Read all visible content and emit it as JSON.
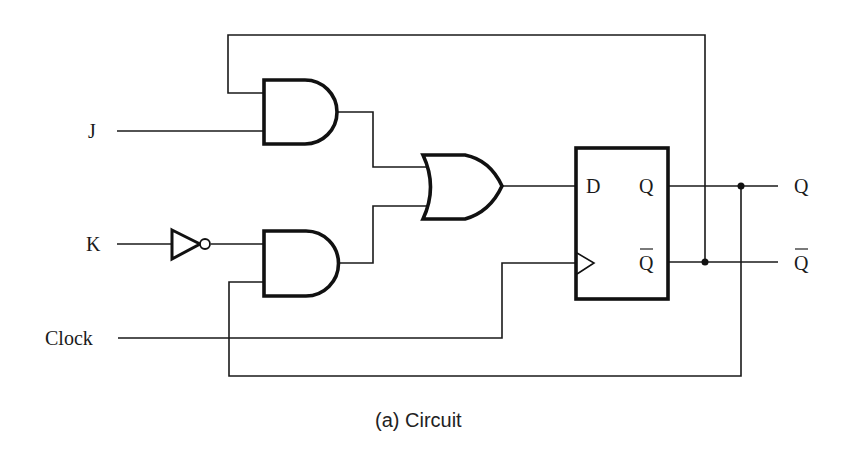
{
  "diagram": {
    "type": "logic-circuit",
    "caption": "(a) Circuit",
    "inputs": {
      "j": "J",
      "k": "K",
      "clock": "Clock"
    },
    "flipflop": {
      "d": "D",
      "q": "Q",
      "qbar": "Q"
    },
    "outputs": {
      "q": "Q",
      "qbar": "Q"
    },
    "components": [
      "AND gate (J)",
      "AND gate (K)",
      "NOT gate",
      "OR gate",
      "D flip-flop"
    ]
  }
}
